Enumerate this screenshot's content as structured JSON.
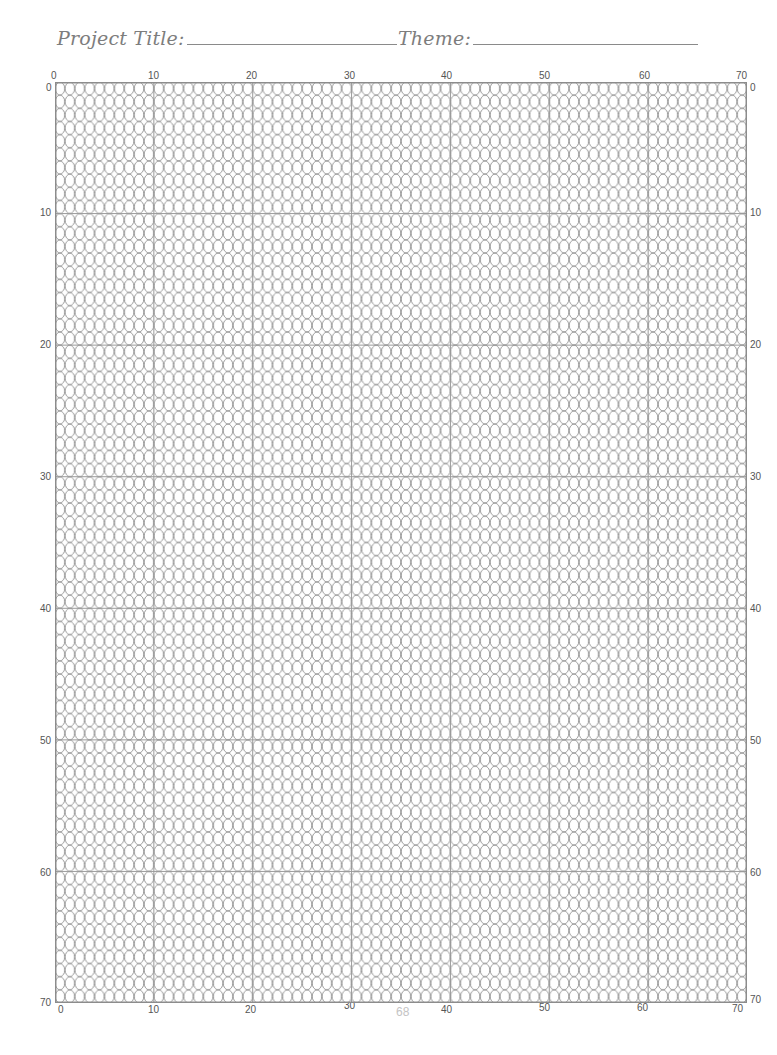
{
  "header": {
    "project_title_label": "Project Title:",
    "project_title_value": "",
    "theme_label": "Theme:",
    "theme_value": ""
  },
  "grid": {
    "columns": 70,
    "rows": 70,
    "major_interval": 10,
    "cell_shape": "vertical-oval",
    "top_axis_labels": [
      "0",
      "10",
      "20",
      "30",
      "40",
      "50",
      "60",
      "70"
    ],
    "bottom_axis_labels": [
      "0",
      "10",
      "20",
      "30",
      "40",
      "50",
      "60",
      "70"
    ],
    "left_axis_labels": [
      "0",
      "10",
      "20",
      "30",
      "40",
      "50",
      "60",
      "70"
    ],
    "right_axis_labels": [
      "0",
      "10",
      "20",
      "30",
      "40",
      "50",
      "60",
      "70"
    ],
    "colors": {
      "oval_stroke": "#8c8c8c",
      "major_line": "#9a9a9a",
      "border": "#8c8c8c"
    }
  },
  "footer": {
    "page_number": "68"
  }
}
